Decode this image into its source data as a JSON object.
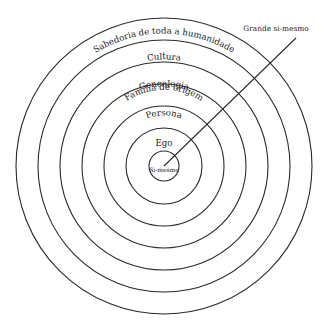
{
  "diagram": {
    "type": "concentric-circles",
    "center": {
      "x": 164,
      "y": 166
    },
    "rings": [
      {
        "id": "si-mesmo",
        "label": "Si-mesmo",
        "radius": 15
      },
      {
        "id": "ego",
        "label": "Ego",
        "radius": 38
      },
      {
        "id": "persona",
        "label": "Persona",
        "radius": 60
      },
      {
        "id": "familia",
        "label": "Família de origem",
        "radius": 82
      },
      {
        "id": "genealogia",
        "label": "Genealogia",
        "radius": 104
      },
      {
        "id": "cultura",
        "label": "Cultura",
        "radius": 126
      },
      {
        "id": "sabedoria",
        "label": "Sabedoria de toda a humanidade",
        "radius": 148
      }
    ],
    "pointer": {
      "label": "Grande si-mesmo",
      "from": {
        "x": 164,
        "y": 166
      },
      "to": {
        "x": 296,
        "y": 38
      }
    },
    "colors": {
      "stroke": "#2a2a2a",
      "text": "#1a1a1a",
      "background": "#ffffff"
    }
  }
}
